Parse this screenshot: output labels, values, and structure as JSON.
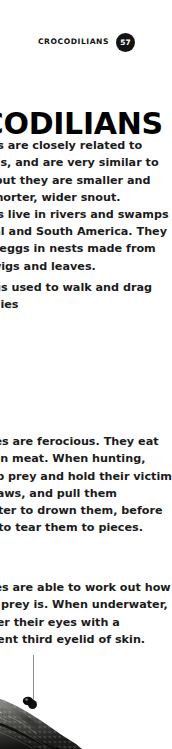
{
  "page": {
    "background_color": "#ffffff",
    "text_color": "#1b1b1b",
    "badge_color": "#131313"
  },
  "header": {
    "label": "CROCODILIANS",
    "page_number": "57"
  },
  "headline": "CROCODILIANS",
  "body": {
    "intro": "Alligators are closely related to crocodiles, and are very similar to look at, but they are smaller and have a shorter, wider snout. Alligators live in rivers and swamps in Central and South America. They lay their eggs in nests made from grass, twigs and leaves.",
    "legs": "Short legs used to walk and drag their bellies",
    "hunting": "Crocodiles are ferocious. They eat more than meat. When hunting, they grab prey and hold their victim in their jaws, and pull them underwater to drown them, before twisting to tear them to pieces.",
    "eyes": "Crocodiles are able to work out how far away prey is. When underwater, they cover their eyes with a transparent third eyelid of skin."
  },
  "figure": {
    "caption_marker": "leader-line-to-eye"
  }
}
